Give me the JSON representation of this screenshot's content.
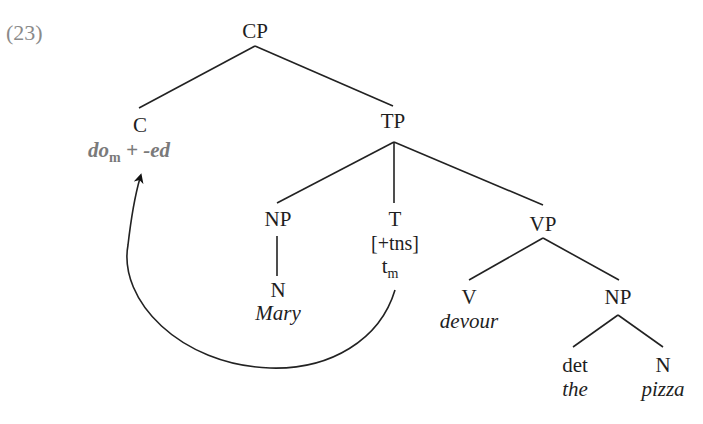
{
  "example_number": "(23)",
  "colors": {
    "text": "#1e1e1e",
    "moved_element": "#7a7a7a",
    "number": "#8a8a8a",
    "lines": "#222222"
  },
  "tree": {
    "cp": {
      "label": "CP"
    },
    "c": {
      "label": "C",
      "content": {
        "base": "do",
        "subscript": "m",
        "rest": " + -ed"
      }
    },
    "tp": {
      "label": "TP"
    },
    "np_subject": {
      "label": "NP"
    },
    "n_subject": {
      "label": "N",
      "word": "Mary"
    },
    "t": {
      "label": "T",
      "feature": "[+tns]",
      "trace": {
        "base": "t",
        "subscript": "m"
      }
    },
    "vp": {
      "label": "VP"
    },
    "v": {
      "label": "V",
      "word": "devour"
    },
    "np_object": {
      "label": "NP"
    },
    "det": {
      "label": "det",
      "word": "the"
    },
    "n_object": {
      "label": "N",
      "word": "pizza"
    }
  },
  "movement": {
    "from": "t",
    "to": "c",
    "description": "T-to-C movement arrow"
  }
}
